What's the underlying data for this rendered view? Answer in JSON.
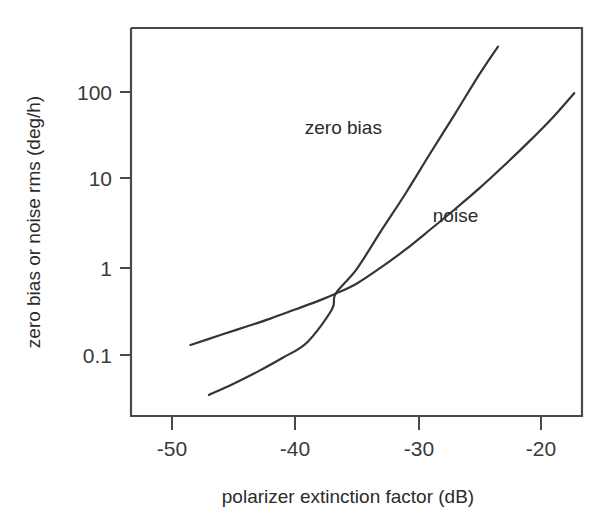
{
  "chart_data": {
    "type": "line",
    "title": "",
    "xlabel": "polarizer extinction factor (dB)",
    "ylabel": "zero bias or noise rms  (deg/h)",
    "xlim": [
      -54,
      -17
    ],
    "ylim": [
      0.03,
      500
    ],
    "yscale": "log",
    "xscale": "linear",
    "grid": false,
    "legend": "inline-annotations",
    "xticks": [
      -50,
      -40,
      -30,
      -20
    ],
    "xtick_labels": [
      "-50",
      "-40",
      "-30",
      "-20"
    ],
    "yticks": [
      0.1,
      1,
      10,
      100
    ],
    "ytick_labels": [
      "0.1",
      "1",
      "10",
      "100"
    ],
    "series": [
      {
        "name": "zero bias",
        "label": "zero bias",
        "color": "#353535",
        "x": [
          -47.0,
          -45.0,
          -43.0,
          -41.0,
          -39.0,
          -37.0,
          -36.7,
          -35.0,
          -33.0,
          -31.0,
          -29.0,
          -27.0,
          -25.0,
          -23.5
        ],
        "y": [
          0.035,
          0.047,
          0.065,
          0.093,
          0.14,
          0.33,
          0.5,
          0.95,
          2.6,
          7.0,
          20.0,
          56.0,
          160.0,
          330.0
        ]
      },
      {
        "name": "noise",
        "label": "noise",
        "color": "#353535",
        "x": [
          -48.5,
          -46.0,
          -44.0,
          -42.0,
          -40.0,
          -38.0,
          -36.7,
          -35.0,
          -33.0,
          -31.0,
          -29.0,
          -27.0,
          -25.0,
          -23.0,
          -21.0,
          -19.0,
          -17.3
        ],
        "y": [
          0.13,
          0.17,
          0.21,
          0.26,
          0.33,
          0.42,
          0.5,
          0.65,
          1.0,
          1.6,
          2.7,
          4.6,
          8.0,
          14.5,
          27.0,
          52.0,
          97.0
        ]
      }
    ],
    "annotations": [
      {
        "text": "zero bias",
        "x": -39.2,
        "y": 33.0
      },
      {
        "text": "noise",
        "x": -28.8,
        "y": 3.3
      }
    ]
  }
}
